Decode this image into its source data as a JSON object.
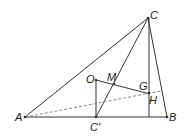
{
  "diagram": {
    "type": "geometry",
    "points": {
      "A": {
        "label": "A",
        "x": 25,
        "y": 117
      },
      "B": {
        "label": "B",
        "x": 167,
        "y": 117
      },
      "C": {
        "label": "C",
        "x": 148,
        "y": 18
      },
      "C_prime": {
        "label": "C'",
        "x": 96,
        "y": 117
      },
      "O": {
        "label": "O",
        "x": 96,
        "y": 80
      },
      "M": {
        "label": "M",
        "x": 114,
        "y": 84
      },
      "G": {
        "label": "G",
        "x": 143,
        "y": 90
      },
      "H": {
        "label": "H",
        "x": 149,
        "y": 93
      }
    },
    "colors": {
      "line": "#333333",
      "dashed": "#888888",
      "background": "#ffffff"
    }
  }
}
